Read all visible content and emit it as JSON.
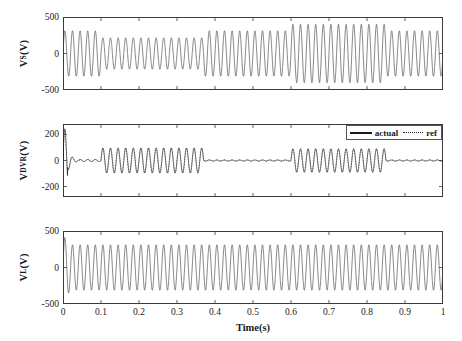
{
  "figure": {
    "xaxis": {
      "title": "Time(s)",
      "ticks": [
        "0",
        "0.1",
        "0.2",
        "0.3",
        "0.4",
        "0.5",
        "0.6",
        "0.7",
        "0.8",
        "0.9",
        "1"
      ],
      "min": 0,
      "max": 1
    },
    "legend": {
      "actual_label": "actual",
      "ref_label": "ref"
    },
    "panels": [
      {
        "name": "source-voltage",
        "ylabel_main": "V",
        "ylabel_sub": "S",
        "ylabel_unit": "(V)",
        "yticks": [
          "500",
          "0",
          "-500"
        ],
        "ymin": -500,
        "ymax": 500
      },
      {
        "name": "dvr-injected-voltage",
        "ylabel_main": "V",
        "ylabel_sub": "DVR",
        "ylabel_unit": "(V)",
        "yticks": [
          "200",
          "0",
          "-200"
        ],
        "ymin": -280,
        "ymax": 280
      },
      {
        "name": "load-voltage",
        "ylabel_main": "V",
        "ylabel_sub": "L",
        "ylabel_unit": "(V)",
        "yticks": [
          "500",
          "0",
          "-500"
        ],
        "ymin": -500,
        "ymax": 500
      }
    ]
  },
  "chart_data": {
    "type": "line",
    "title": "",
    "xlabel": "Time(s)",
    "subplots": [
      {
        "id": "Vs",
        "ylabel": "V_S(V)",
        "ylim": [
          -500,
          500
        ],
        "xlim": [
          0,
          1
        ],
        "yticks": [
          500,
          0,
          -500
        ],
        "frequency_hz": 50,
        "description": "Source voltage with a voltage sag and a voltage swell event",
        "series": [
          {
            "name": "actual",
            "style": "solid",
            "color": "#444444",
            "envelope": [
              {
                "t_start": 0.0,
                "t_end": 0.1,
                "amplitude": 311,
                "state": "nominal"
              },
              {
                "t_start": 0.1,
                "t_end": 0.37,
                "amplitude": 215,
                "state": "sag"
              },
              {
                "t_start": 0.37,
                "t_end": 0.6,
                "amplitude": 311,
                "state": "nominal"
              },
              {
                "t_start": 0.6,
                "t_end": 0.85,
                "amplitude": 400,
                "state": "swell"
              },
              {
                "t_start": 0.85,
                "t_end": 1.0,
                "amplitude": 311,
                "state": "nominal"
              }
            ]
          }
        ]
      },
      {
        "id": "Vdvr",
        "ylabel": "V_DVR(V)",
        "ylim": [
          -280,
          280
        ],
        "xlim": [
          0,
          1
        ],
        "yticks": [
          200,
          0,
          -200
        ],
        "frequency_hz": 50,
        "description": "DVR injected compensation voltage; initial start-up transient, injection during sag and during swell, zero otherwise",
        "series": [
          {
            "name": "actual",
            "style": "solid",
            "color": "#1a1a1a",
            "envelope": [
              {
                "t_start": 0.0,
                "t_end": 0.012,
                "amplitude": 270,
                "state": "startup-transient"
              },
              {
                "t_start": 0.012,
                "t_end": 0.045,
                "amplitude": 90,
                "state": "decaying-transient"
              },
              {
                "t_start": 0.045,
                "t_end": 0.1,
                "amplitude": 8,
                "state": "zero"
              },
              {
                "t_start": 0.1,
                "t_end": 0.37,
                "amplitude": 96,
                "state": "sag-compensation"
              },
              {
                "t_start": 0.37,
                "t_end": 0.6,
                "amplitude": 4,
                "state": "zero"
              },
              {
                "t_start": 0.6,
                "t_end": 0.85,
                "amplitude": 90,
                "state": "swell-compensation"
              },
              {
                "t_start": 0.85,
                "t_end": 1.0,
                "amplitude": 4,
                "state": "zero"
              }
            ]
          },
          {
            "name": "ref",
            "style": "dotted",
            "color": "#1a1a1a",
            "note": "reference overlaps the actual trace"
          }
        ]
      },
      {
        "id": "VL",
        "ylabel": "V_L(V)",
        "ylim": [
          -500,
          500
        ],
        "xlim": [
          0,
          1
        ],
        "yticks": [
          500,
          0,
          -500
        ],
        "frequency_hz": 50,
        "description": "Load voltage held constant at nominal after a brief start-up transient",
        "series": [
          {
            "name": "actual",
            "style": "solid",
            "color": "#444444",
            "envelope": [
              {
                "t_start": 0.0,
                "t_end": 0.018,
                "amplitude": 440,
                "state": "startup-transient"
              },
              {
                "t_start": 0.018,
                "t_end": 1.0,
                "amplitude": 311,
                "state": "regulated-nominal"
              }
            ]
          }
        ]
      }
    ]
  }
}
